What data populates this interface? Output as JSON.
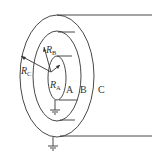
{
  "diagram": {
    "type": "coaxial-cylinders",
    "labels": {
      "radius_A": {
        "main": "R",
        "sub": "A"
      },
      "radius_B": {
        "main": "R",
        "sub": "B"
      },
      "radius_C": {
        "main": "R",
        "sub": "C"
      },
      "region_A": "A",
      "region_B": "B",
      "region_C": "C"
    },
    "grounds": [
      "inner-conductor-ground",
      "outer-conductor-ground"
    ],
    "colors": {
      "stroke": "#333333",
      "background": "#ffffff"
    }
  }
}
